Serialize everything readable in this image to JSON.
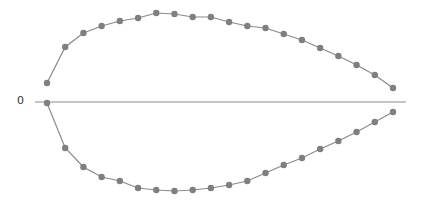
{
  "chart_data": {
    "type": "line",
    "title": "",
    "xlabel": "",
    "ylabel": "",
    "y_tick_labels": [
      "0"
    ],
    "grid": false,
    "legend": null,
    "x": [
      1,
      2,
      3,
      4,
      5,
      6,
      7,
      8,
      9,
      10,
      11,
      12,
      13,
      14,
      15,
      16,
      17,
      18,
      19,
      20
    ],
    "series": [
      {
        "name": "upper",
        "values": [
          19,
          55,
          69,
          76,
          81,
          84,
          89,
          88,
          85,
          85,
          80,
          76,
          74,
          68,
          62,
          54,
          46,
          37,
          27,
          14
        ]
      },
      {
        "name": "lower",
        "values": [
          -1,
          -46,
          -65,
          -75,
          -79,
          -86,
          -88,
          -89,
          -88,
          -86,
          -83,
          -79,
          -71,
          -63,
          -56,
          -47,
          -39,
          -30,
          -20,
          -10
        ]
      }
    ],
    "colors": {
      "line": "#8a8a8a",
      "marker": "#7f7f7f",
      "axis": "#8c8c8c"
    }
  },
  "labels": {
    "zero": "0"
  }
}
